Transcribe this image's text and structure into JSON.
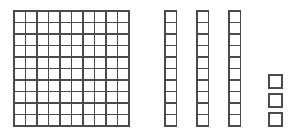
{
  "diagram": {
    "type": "base-ten-blocks",
    "total_value": 133,
    "stroke_color": "#4a4a4a",
    "fill_color": "#ffffff",
    "background_color": "#ffffff",
    "canvas": {
      "width": 298,
      "height": 131
    },
    "groups": [
      {
        "name": "hundreds-flat",
        "label": "hundred flat",
        "place_value": "hundreds",
        "unit_value": 100,
        "count": 1,
        "value": 100,
        "rows": 10,
        "columns": 10,
        "cells": 100,
        "x": 14,
        "y": 11,
        "cell_size": 11.5,
        "stroke_width": 1.1
      },
      {
        "name": "tens-rods",
        "label": "ten rods",
        "place_value": "tens",
        "unit_value": 10,
        "count": 3,
        "value": 30,
        "rows": 10,
        "columns": 1,
        "cells_each": 10,
        "cell_size": 11.5,
        "stroke_width": 1.1,
        "y": 11,
        "x_positions": [
          165,
          197,
          229
        ]
      },
      {
        "name": "ones-cubes",
        "label": "unit cubes",
        "place_value": "ones",
        "unit_value": 1,
        "count": 3,
        "value": 3,
        "cell_size": 13,
        "stroke_width": 1.4,
        "x": 269,
        "y_positions": [
          75,
          94,
          113
        ]
      }
    ]
  }
}
